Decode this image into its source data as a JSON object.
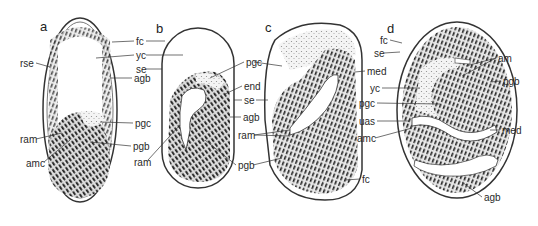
{
  "figure": {
    "panels": [
      {
        "id": "a",
        "label": "a",
        "x": 40,
        "y": 20
      },
      {
        "id": "b",
        "label": "b",
        "x": 156,
        "y": 22
      },
      {
        "id": "c",
        "label": "c",
        "x": 265,
        "y": 21
      },
      {
        "id": "d",
        "label": "d",
        "x": 387,
        "y": 22
      }
    ],
    "labels": [
      {
        "text": "rse",
        "x": 20,
        "y": 59
      },
      {
        "text": "fc",
        "x": 136,
        "y": 37
      },
      {
        "text": "yc",
        "x": 136,
        "y": 51
      },
      {
        "text": "se",
        "x": 136,
        "y": 65
      },
      {
        "text": "agb",
        "x": 134,
        "y": 74
      },
      {
        "text": "pgc",
        "x": 135,
        "y": 119
      },
      {
        "text": "ram",
        "x": 20,
        "y": 135
      },
      {
        "text": "pgb",
        "x": 133,
        "y": 142
      },
      {
        "text": "amc",
        "x": 26,
        "y": 159
      },
      {
        "text": "ram",
        "x": 134,
        "y": 158
      },
      {
        "text": "pgc",
        "x": 246,
        "y": 58
      },
      {
        "text": "end",
        "x": 244,
        "y": 82
      },
      {
        "text": "se",
        "x": 244,
        "y": 96
      },
      {
        "text": "agb",
        "x": 243,
        "y": 113
      },
      {
        "text": "ram",
        "x": 238,
        "y": 131
      },
      {
        "text": "pgb",
        "x": 238,
        "y": 161
      },
      {
        "text": "med",
        "x": 367,
        "y": 67
      },
      {
        "text": "fc",
        "x": 362,
        "y": 175
      },
      {
        "text": "fc",
        "x": 380,
        "y": 36
      },
      {
        "text": "se",
        "x": 374,
        "y": 49
      },
      {
        "text": "yc",
        "x": 370,
        "y": 84
      },
      {
        "text": "pgc",
        "x": 359,
        "y": 99
      },
      {
        "text": "uas",
        "x": 359,
        "y": 117
      },
      {
        "text": "amc",
        "x": 357,
        "y": 134
      },
      {
        "text": "am",
        "x": 498,
        "y": 54
      },
      {
        "text": "pgb",
        "x": 503,
        "y": 77
      },
      {
        "text": "med",
        "x": 502,
        "y": 126
      },
      {
        "text": "agb",
        "x": 484,
        "y": 193
      }
    ]
  }
}
